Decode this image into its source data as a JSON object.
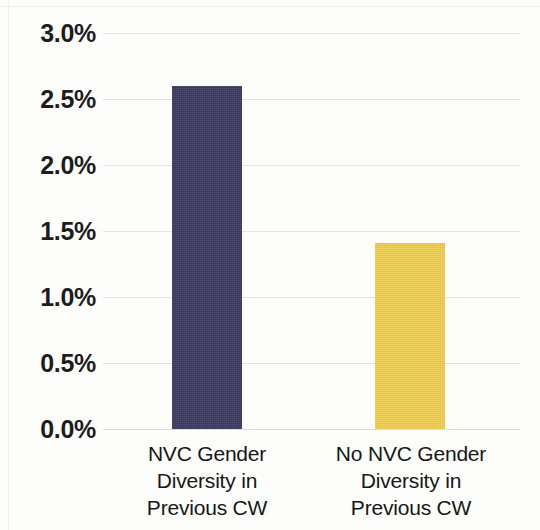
{
  "chart_data": {
    "type": "bar",
    "title": "",
    "subtitle": "",
    "xlabel": "",
    "ylabel": "",
    "categories": [
      "NVC Gender Diversity in Previous CW",
      "No NVC Gender Diversity in Previous CW"
    ],
    "category_lines": [
      [
        "NVC Gender",
        "Diversity in",
        "Previous CW"
      ],
      [
        "No NVC Gender",
        "Diversity in",
        "Previous CW"
      ]
    ],
    "values": [
      2.6,
      1.41
    ],
    "value_labels": [
      "2.6%",
      "1.41%"
    ],
    "unit": "%",
    "ylim": [
      0.0,
      3.0
    ],
    "ytick_values": [
      3.0,
      2.5,
      2.0,
      1.5,
      1.0,
      0.5,
      0.0
    ],
    "ytick_labels": [
      "3.0%",
      "2.5%",
      "2.0%",
      "1.5%",
      "1.0%",
      "0.5%",
      "0.0%"
    ],
    "grid": true,
    "grid_axis": "y",
    "legend": false,
    "legend_position": "none",
    "bar_colors": [
      "#3b3a62",
      "#efd050"
    ],
    "series": [
      {
        "name": "Share",
        "values": [
          2.6,
          1.41
        ]
      }
    ]
  },
  "colors": {
    "navy": "#3b3a62",
    "gold": "#efd050",
    "gridline": "#e4e4e6",
    "text": "#1d1d1d",
    "background": "#fdfdfc"
  },
  "axis": {
    "ticks": [
      {
        "label": "3.0%",
        "value": 3.0
      },
      {
        "label": "2.5%",
        "value": 2.5
      },
      {
        "label": "2.0%",
        "value": 2.0
      },
      {
        "label": "1.5%",
        "value": 1.5
      },
      {
        "label": "1.0%",
        "value": 1.0
      },
      {
        "label": "0.5%",
        "value": 0.5
      },
      {
        "label": "0.0%",
        "value": 0.0
      }
    ]
  },
  "bars": [
    {
      "name": "nvc-gender-diversity",
      "value": 2.6,
      "color": "#3b3a62",
      "lines": {
        "l1": "NVC Gender",
        "l2": "Diversity in",
        "l3": "Previous CW"
      }
    },
    {
      "name": "no-nvc-gender-diversity",
      "value": 1.41,
      "color": "#efd050",
      "lines": {
        "l1": "No NVC Gender",
        "l2": "Diversity in",
        "l3": "Previous CW"
      }
    }
  ]
}
